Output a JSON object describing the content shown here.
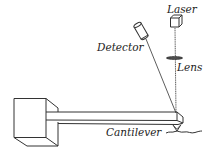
{
  "diagram": {
    "type": "afm-schematic",
    "labels": {
      "laser": "Laser",
      "detector": "Detector",
      "lens": "Lens",
      "cantilever": "Cantilever"
    },
    "colors": {
      "stroke": "#333333",
      "background": "#ffffff"
    }
  }
}
